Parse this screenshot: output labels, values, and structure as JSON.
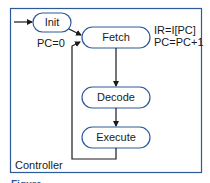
{
  "diagram": {
    "type": "state-machine",
    "container_label": "Controller",
    "colors": {
      "border": "#2f5a9a",
      "line": "#1a1a1a",
      "text": "#1a1a1a"
    },
    "states": [
      {
        "id": "init",
        "label": "Init",
        "action": "PC=0"
      },
      {
        "id": "fetch",
        "label": "Fetch",
        "action_lines": [
          "IR=I[PC]",
          "PC=PC+1"
        ]
      },
      {
        "id": "decode",
        "label": "Decode"
      },
      {
        "id": "execute",
        "label": "Execute"
      }
    ],
    "transitions": [
      {
        "from": "start",
        "to": "init"
      },
      {
        "from": "init",
        "to": "fetch"
      },
      {
        "from": "fetch",
        "to": "decode"
      },
      {
        "from": "decode",
        "to": "execute"
      },
      {
        "from": "execute",
        "to": "fetch"
      }
    ]
  },
  "caption": "Figure"
}
